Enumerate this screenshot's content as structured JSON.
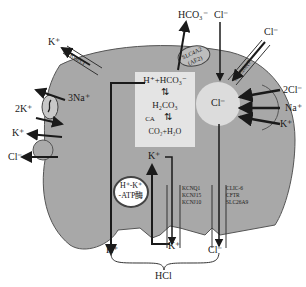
{
  "figure": {
    "type": "parietal cell ion transport diagram",
    "colors": {
      "cell": "#a8a8a8",
      "outline": "#555555",
      "inner_box": "#e6e6e6",
      "white": "#ffffff",
      "arrow": "#1a1a1a"
    }
  },
  "basolateral": {
    "k_channel": {
      "ion": "K⁺",
      "label": "Kcn3.1"
    },
    "na_k_pump": {
      "in_ion": "2K⁺",
      "out_ion": "3Na⁺"
    },
    "k_cl_cotransporter": {
      "k_ion": "K⁺",
      "cl_ion": "Cl⁻"
    },
    "ae2": {
      "label_line1": "SLC4A2",
      "label_line2": "(AE2)",
      "out_ion": "HCO₃⁻",
      "in_ion": "Cl⁻"
    },
    "slc26a7": {
      "label": "SLC26A7",
      "ion": "Cl⁻"
    },
    "nkcc": {
      "ions": [
        "2Cl⁻",
        "Na⁺",
        "K⁺"
      ]
    }
  },
  "cytoplasm": {
    "reaction": {
      "top": "H⁺+HCO₃⁻",
      "middle": "H₂CO₃",
      "enzyme": "CA",
      "bottom": "CO₂+H₂O"
    },
    "cl_pool": "Cl⁻"
  },
  "apical": {
    "pump": {
      "line1": "H⁺-K⁺",
      "line2": "-ATP酶"
    },
    "k_recycle_ion": "K⁺",
    "k_channels": [
      "KCNQ1",
      "KCNJ15",
      "KCNJ10"
    ],
    "cl_channels": [
      "CLIC-6",
      "CFTR",
      "SLC26A9"
    ],
    "secreted": {
      "h": "H⁺",
      "k": "K⁺",
      "cl": "Cl⁻"
    },
    "product": "HCl"
  }
}
